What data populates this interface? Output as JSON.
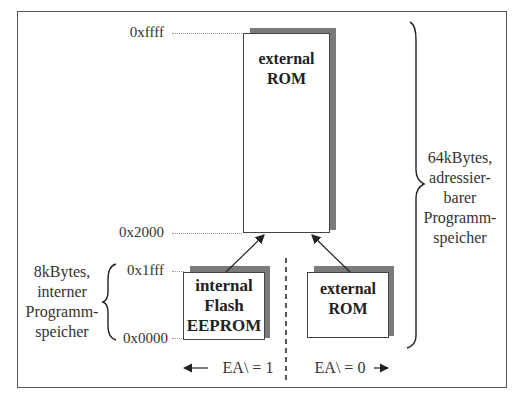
{
  "diagram": {
    "addresses": {
      "top": "0xffff",
      "ext_start": "0x2000",
      "int_end": "0x1fff",
      "int_start": "0x0000"
    },
    "boxes": {
      "external_rom_large": {
        "line1": "external",
        "line2": "ROM"
      },
      "internal_flash": {
        "line1": "internal",
        "line2": "Flash",
        "line3": "EEPROM"
      },
      "external_rom_small": {
        "line1": "external",
        "line2": "ROM"
      }
    },
    "labels": {
      "left": {
        "line1": "8kBytes,",
        "line2": "interner",
        "line3": "Programm-",
        "line4": "speicher"
      },
      "right": {
        "line1": "64kBytes,",
        "line2": "adressier-",
        "line3": "barer",
        "line4": "Programm-",
        "line5": "speicher"
      }
    },
    "ea_left": "EA\\ = 1",
    "ea_right": "EA\\ = 0",
    "colors": {
      "shadow": "#7a7a7a",
      "border": "#444444",
      "frame": "#555555"
    }
  }
}
